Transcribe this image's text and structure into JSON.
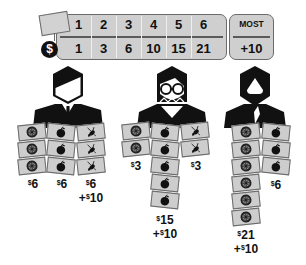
{
  "scoring_table": {
    "tag_icon": "price-tag-icon",
    "currency_icon": "dollar-coin-icon",
    "currency_symbol": "$",
    "set_sizes": [
      "1",
      "2",
      "3",
      "4",
      "5",
      "6"
    ],
    "points": [
      "1",
      "3",
      "6",
      "10",
      "15",
      "21"
    ],
    "most_bonus": {
      "label": "MOST",
      "value": "+10"
    }
  },
  "card_icons": {
    "wheel": "wheel-icon",
    "apple": "apple-icon",
    "bug": "beetle-icon"
  },
  "players": [
    {
      "avatar": "man-in-suit-avatar",
      "columns": [
        {
          "icon": "wheel",
          "count": 3,
          "score": "6",
          "bonus": ""
        },
        {
          "icon": "apple",
          "count": 3,
          "score": "6",
          "bonus": ""
        },
        {
          "icon": "bug",
          "count": 3,
          "score": "6",
          "bonus": "10"
        }
      ]
    },
    {
      "avatar": "woman-with-glasses-avatar",
      "columns": [
        {
          "icon": "wheel",
          "count": 2,
          "score": "3",
          "bonus": ""
        },
        {
          "icon": "apple",
          "count": 5,
          "score": "15",
          "bonus": "10"
        },
        {
          "icon": "bug",
          "count": 2,
          "score": "3",
          "bonus": ""
        }
      ]
    },
    {
      "avatar": "hooded-figure-avatar",
      "columns": [
        {
          "icon": "wheel",
          "count": 6,
          "score": "21",
          "bonus": "10"
        },
        {
          "icon": "apple",
          "count": 3,
          "score": "6",
          "bonus": ""
        }
      ]
    }
  ],
  "labels": {
    "p1_c1": "6",
    "p1_c2": "6",
    "p1_c3": "6",
    "p1_c3_bonus": "10",
    "p2_c1": "3",
    "p2_c2": "15",
    "p2_c2_bonus": "10",
    "p2_c3": "3",
    "p3_c1": "21",
    "p3_c1_bonus": "10",
    "p3_c2": "6",
    "dollar": "$",
    "plus": "+"
  },
  "colors": {
    "panel_fill": "#cfcfcf",
    "panel_border": "#6b6b6b",
    "ink": "#111111",
    "card_fill": "#cdcdcd"
  }
}
